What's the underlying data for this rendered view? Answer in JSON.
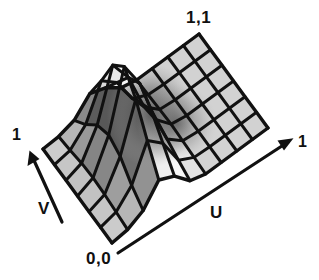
{
  "figure": {
    "background_color": "#ffffff",
    "width": 319,
    "height": 280
  },
  "labels": {
    "corner_origin": "0,0",
    "corner_far": "1,1",
    "u_axis": "U",
    "v_axis": "V",
    "u_max": "1",
    "v_max": "1"
  },
  "colors": {
    "background": "#ffffff",
    "wire": "#111111",
    "face_light": "#e9e9e9",
    "face_mid": "#c2c2c2",
    "face_dark": "#4a4a4a",
    "text": "#101010",
    "axis": "#111111"
  },
  "chart_data": {
    "type": "surface",
    "xlabel": "U",
    "ylabel": "V",
    "xlim": [
      0,
      1
    ],
    "ylim": [
      0,
      1
    ],
    "grid": true,
    "legend": false,
    "grid_u_divisions": 11,
    "grid_v_divisions": 7,
    "annotations": [
      {
        "text": "0,0",
        "role": "near-corner-origin"
      },
      {
        "text": "1,1",
        "role": "far-corner"
      },
      {
        "text": "1",
        "role": "u-axis-max"
      },
      {
        "text": "1",
        "role": "v-axis-max"
      },
      {
        "text": "U",
        "role": "u-axis-name"
      },
      {
        "text": "V",
        "role": "v-axis-name"
      }
    ],
    "height_field": {
      "u": [
        0.0,
        0.1,
        0.2,
        0.3,
        0.4,
        0.5,
        0.6,
        0.7,
        0.8,
        0.9,
        1.0
      ],
      "v": [
        0.0,
        0.1667,
        0.3333,
        0.5,
        0.6667,
        0.8333,
        1.0
      ],
      "z": [
        [
          0.0,
          0.02,
          0.1,
          0.3,
          0.22,
          0.05,
          0.0,
          0.0,
          0.0,
          0.0,
          0.0
        ],
        [
          0.0,
          0.04,
          0.2,
          0.55,
          0.4,
          0.1,
          0.01,
          0.0,
          0.0,
          0.0,
          0.0
        ],
        [
          0.0,
          0.06,
          0.34,
          0.82,
          0.58,
          0.16,
          0.02,
          0.0,
          0.0,
          0.0,
          0.0
        ],
        [
          0.0,
          0.07,
          0.4,
          1.0,
          0.7,
          0.2,
          0.03,
          0.0,
          0.0,
          0.0,
          0.0
        ],
        [
          0.0,
          0.06,
          0.34,
          0.85,
          0.6,
          0.17,
          0.02,
          0.0,
          0.0,
          0.0,
          0.0
        ],
        [
          0.0,
          0.03,
          0.18,
          0.52,
          0.38,
          0.09,
          0.01,
          0.0,
          0.0,
          0.0,
          0.0
        ],
        [
          0.0,
          0.01,
          0.06,
          0.22,
          0.16,
          0.04,
          0.0,
          0.0,
          0.0,
          0.0,
          0.0
        ]
      ]
    },
    "projection": {
      "type": "oblique",
      "base_corner_00": [
        112,
        243
      ],
      "base_corner_u1": [
        268,
        128
      ],
      "base_corner_v1": [
        43,
        149
      ],
      "height_scale": 95
    }
  }
}
